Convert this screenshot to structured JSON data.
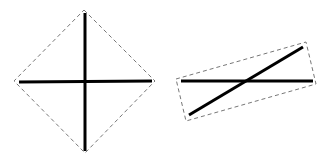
{
  "figures": [
    {
      "name": "diamond-cross",
      "outline": {
        "style": "dashed",
        "color": "#777777",
        "points": [
          [
            84,
            10
          ],
          [
            155,
            81
          ],
          [
            85,
            153
          ],
          [
            14,
            81
          ]
        ]
      },
      "lines": [
        {
          "x1": 85,
          "y1": 13,
          "x2": 85,
          "y2": 151,
          "color": "#000000",
          "width": 3
        },
        {
          "x1": 19,
          "y1": 82,
          "x2": 152,
          "y2": 81,
          "color": "#000000",
          "width": 3
        }
      ]
    },
    {
      "name": "rotated-rectangle-lines",
      "outline": {
        "style": "dashed",
        "color": "#777777",
        "points": [
          [
            176,
            79
          ],
          [
            306,
            42
          ],
          [
            316,
            84
          ],
          [
            186,
            121
          ]
        ]
      },
      "lines": [
        {
          "x1": 181,
          "y1": 81,
          "x2": 313,
          "y2": 81,
          "color": "#000000",
          "width": 3
        },
        {
          "x1": 189,
          "y1": 115,
          "x2": 303,
          "y2": 47,
          "color": "#000000",
          "width": 3
        }
      ]
    }
  ]
}
